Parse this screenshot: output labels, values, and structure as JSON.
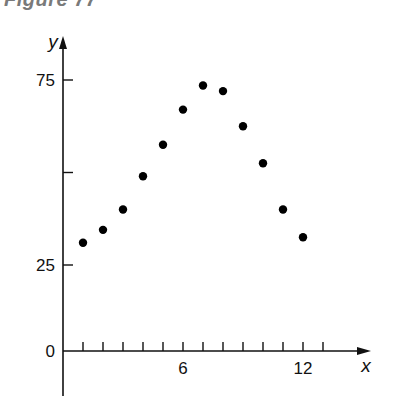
{
  "figure": {
    "title": "Figure 77"
  },
  "chart_data": {
    "type": "scatter",
    "title": "Figure 77",
    "xlabel": "x",
    "ylabel": "y",
    "x_ticks": [
      1,
      2,
      3,
      4,
      5,
      6,
      7,
      8,
      9,
      10,
      11,
      12,
      13
    ],
    "x_tick_labels": [
      "6",
      "12"
    ],
    "y_ticks": [
      0,
      25,
      50,
      75
    ],
    "y_tick_labels": [
      "0",
      "25",
      "75"
    ],
    "xlim": [
      0,
      14
    ],
    "ylim": [
      0,
      80
    ],
    "grid": false,
    "legend": null,
    "series": [
      {
        "name": "data",
        "x": [
          1,
          2,
          3,
          4,
          5,
          6,
          7,
          8,
          9,
          10,
          11,
          12
        ],
        "y": [
          31,
          34.5,
          40,
          49,
          57.5,
          67,
          73.5,
          72,
          62.5,
          52.5,
          40,
          32.5
        ]
      }
    ]
  }
}
